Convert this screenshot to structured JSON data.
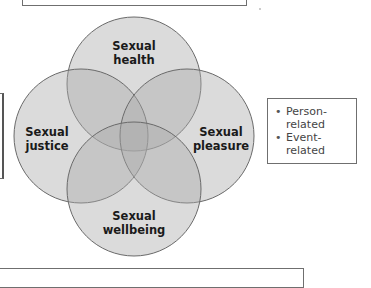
{
  "diagram": {
    "type": "venn-4",
    "circles": [
      {
        "id": "health",
        "label_line1": "Sexual",
        "label_line2": "health",
        "cx": 134,
        "cy": 84,
        "r": 67
      },
      {
        "id": "justice",
        "label_line1": "Sexual",
        "label_line2": "justice",
        "cx": 81,
        "cy": 136,
        "r": 67
      },
      {
        "id": "pleasure",
        "label_line1": "Sexual",
        "label_line2": "pleasure",
        "cx": 187,
        "cy": 136,
        "r": 67
      },
      {
        "id": "wellbeing",
        "label_line1": "Sexual",
        "label_line2": "wellbeing",
        "cx": 134,
        "cy": 189,
        "r": 67
      }
    ],
    "fill_color": "#a9a9a9",
    "stroke_color": "#6a6a6a"
  },
  "legend": {
    "items": [
      "Person-related",
      "Event-related"
    ],
    "item_lines": [
      [
        "Person-",
        "related"
      ],
      [
        "Event-",
        "related"
      ]
    ]
  }
}
